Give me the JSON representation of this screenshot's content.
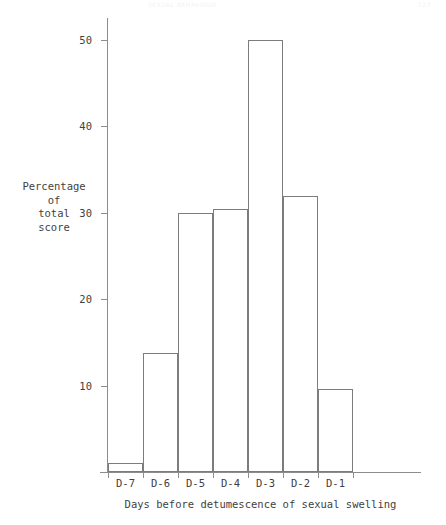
{
  "page_header": {
    "title": "SEXUAL BEHAVIOUR",
    "page_number": "127"
  },
  "chart_data": {
    "type": "bar",
    "title": "",
    "subtitle": "",
    "categories": [
      "D-7",
      "D-6",
      "D-5",
      "D-4",
      "D-3",
      "D-2",
      "D-1"
    ],
    "values": [
      1.0,
      13.8,
      30.0,
      30.4,
      50.0,
      31.9,
      9.6
    ],
    "xlabel": "Days before detumescence of sexual swelling",
    "ylabel": "Percentage\nof\ntotal\nscore",
    "ylabel_lines": [
      "Percentage",
      "of",
      "total",
      "score"
    ],
    "ylim": [
      0,
      53
    ],
    "yticks": [
      10,
      20,
      30,
      40,
      50
    ],
    "ytick_labels": [
      "10",
      "20",
      "30",
      "40",
      "50"
    ],
    "grid": false,
    "legend": "none",
    "bar_style": "outline",
    "bar_gap": 0,
    "axis_color": "#8d8d8d",
    "bar_edge_color": "#7c7c7c",
    "text_color": "#3f3f3f",
    "background": "#ffffff"
  }
}
